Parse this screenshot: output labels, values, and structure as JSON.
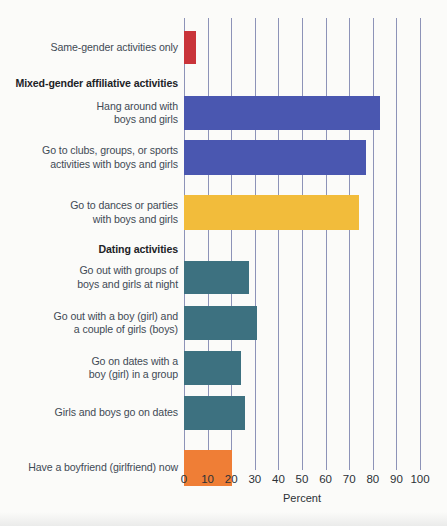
{
  "chart_data": {
    "type": "bar",
    "orientation": "horizontal",
    "title": "",
    "xlabel": "Percent",
    "ylabel": "",
    "xlim": [
      0,
      100
    ],
    "xticks": [
      "0",
      "10",
      "20",
      "30",
      "40",
      "50",
      "60",
      "70",
      "80",
      "90",
      "100"
    ],
    "grid": true,
    "legend": "none",
    "categories": [
      "Same-gender activities only",
      "Mixed-gender affiliative activities",
      "Hang around with\nboys and girls",
      "Go to clubs, groups, or sports\nactivities with boys and girls",
      "Go to dances or parties\nwith boys and girls",
      "Dating activities",
      "Go out with groups of\nboys and girls at night",
      "Go out with a boy (girl) and\na couple of girls (boys)",
      "Go on dates with a\nboy (girl) in a group",
      "Girls and boys go on dates",
      "Have a boyfriend (girlfriend) now"
    ],
    "values": [
      5,
      null,
      83,
      77,
      74,
      null,
      27.5,
      31,
      24,
      26,
      20.5
    ],
    "bars": [
      {
        "label": "Same-gender activities only",
        "value": 5,
        "color": "#c9343a",
        "header": false,
        "top": 13,
        "height": 33
      },
      {
        "label": "Mixed-gender affiliative activities",
        "value": null,
        "color": "",
        "header": true,
        "top": 56,
        "height": 20
      },
      {
        "label": "Hang around with\nboys and girls",
        "value": 83,
        "color": "#4a57b0",
        "header": false,
        "top": 78,
        "height": 34
      },
      {
        "label": "Go to clubs, groups, or sports\nactivities with boys and girls",
        "value": 77,
        "color": "#4a57b0",
        "header": false,
        "top": 122,
        "height": 35
      },
      {
        "label": "Go to dances or parties\nwith boys and girls",
        "value": 74,
        "color": "#f2bc3b",
        "header": false,
        "top": 177,
        "height": 35
      },
      {
        "label": "Dating activities",
        "value": null,
        "color": "",
        "header": true,
        "top": 222,
        "height": 20
      },
      {
        "label": "Go out with groups of\nboys and girls at night",
        "value": 27.5,
        "color": "#3d7180",
        "header": false,
        "top": 243,
        "height": 33
      },
      {
        "label": "Go out with a boy (girl) and\na couple of girls (boys)",
        "value": 31,
        "color": "#3d7180",
        "header": false,
        "top": 288,
        "height": 34
      },
      {
        "label": "Go on dates with a\nboy (girl) in a group",
        "value": 24,
        "color": "#3d7180",
        "header": false,
        "top": 333,
        "height": 34
      },
      {
        "label": "Girls and boys go on dates",
        "value": 26,
        "color": "#3d7180",
        "header": false,
        "top": 378,
        "height": 34
      },
      {
        "label": "Have a boyfriend (girlfriend) now",
        "value": 20.5,
        "color": "#ef7e36",
        "header": false,
        "top": 432,
        "height": 36
      }
    ],
    "colors": {
      "same_gender": "#c9343a",
      "mixed_gender_affiliative": "#4a57b0",
      "dances_parties": "#f2bc3b",
      "dating": "#3d7180",
      "boyfriend_girlfriend": "#ef7e36",
      "gridline": "#8d93b8",
      "label_text": "#3f4a55",
      "background": "#fbfbf9"
    }
  }
}
